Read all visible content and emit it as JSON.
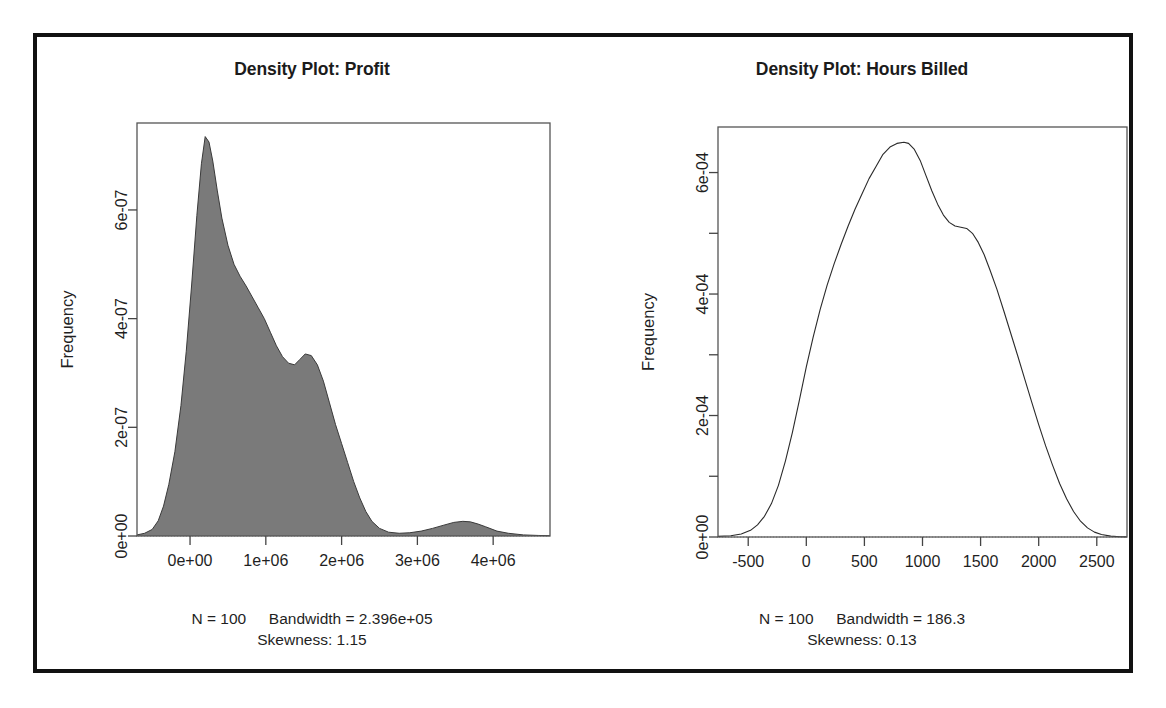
{
  "figure": {
    "background": "#ffffff",
    "border_color": "#111111",
    "panels": [
      {
        "id": "profit",
        "title": "Density Plot: Profit",
        "ylabel": "Frequency",
        "footer_n": "N = 100",
        "footer_bandwidth": "Bandwidth = 2.396e+05",
        "footer_skewness": "Skewness: 1.15"
      },
      {
        "id": "hours-billed",
        "title": "Density Plot: Hours Billed",
        "ylabel": "Frequency",
        "footer_n": "N = 100",
        "footer_bandwidth": "Bandwidth = 186.3",
        "footer_skewness": "Skewness: 0.13"
      }
    ]
  },
  "chart_data": [
    {
      "type": "area",
      "id": "profit",
      "title": "Density Plot: Profit",
      "xlabel": "",
      "ylabel": "Frequency",
      "fill_color": "#7a7a7a",
      "line_color": "#3a3a3a",
      "filled": true,
      "grid": false,
      "legend": null,
      "xlim": [
        -700000,
        4750000
      ],
      "ylim": [
        0,
        7.6e-07
      ],
      "xticks": [
        0,
        1000000,
        2000000,
        3000000,
        4000000
      ],
      "xticklabels": [
        "0e+00",
        "1e+06",
        "2e+06",
        "3e+06",
        "4e+06"
      ],
      "yticks": [
        0,
        2e-07,
        4e-07,
        6e-07
      ],
      "yticklabels": [
        "0e+00",
        "2e-07",
        "4e-07",
        "6e-07"
      ],
      "annotations": [
        "N = 100",
        "Bandwidth = 2.396e+05",
        "Skewness: 1.15"
      ],
      "n": 100,
      "bandwidth": 239600,
      "skewness": 1.15,
      "x": [
        -700000,
        -600000,
        -500000,
        -420000,
        -350000,
        -280000,
        -200000,
        -120000,
        -50000,
        20000,
        90000,
        150000,
        200000,
        250000,
        300000,
        360000,
        420000,
        500000,
        580000,
        660000,
        740000,
        820000,
        900000,
        980000,
        1060000,
        1140000,
        1220000,
        1300000,
        1380000,
        1450000,
        1520000,
        1600000,
        1680000,
        1760000,
        1840000,
        1920000,
        2000000,
        2080000,
        2160000,
        2240000,
        2320000,
        2400000,
        2500000,
        2620000,
        2760000,
        2900000,
        3050000,
        3200000,
        3350000,
        3480000,
        3600000,
        3700000,
        3800000,
        3900000,
        4050000,
        4200000,
        4400000,
        4600000,
        4750000
      ],
      "y": [
        2e-09,
        5e-09,
        1.2e-08,
        2.8e-08,
        5.5e-08,
        9.5e-08,
        1.55e-07,
        2.4e-07,
        3.4e-07,
        4.6e-07,
        5.9e-07,
        6.85e-07,
        7.35e-07,
        7.25e-07,
        6.9e-07,
        6.35e-07,
        5.85e-07,
        5.35e-07,
        5e-07,
        4.78e-07,
        4.6e-07,
        4.4e-07,
        4.2e-07,
        4e-07,
        3.75e-07,
        3.5e-07,
        3.3e-07,
        3.18e-07,
        3.15e-07,
        3.25e-07,
        3.35e-07,
        3.32e-07,
        3.15e-07,
        2.85e-07,
        2.45e-07,
        2.05e-07,
        1.7e-07,
        1.35e-07,
        1e-07,
        7e-08,
        4.5e-08,
        2.7e-08,
        1.4e-08,
        7e-09,
        5e-09,
        6e-09,
        9e-09,
        1.4e-08,
        2e-08,
        2.5e-08,
        2.7e-08,
        2.6e-08,
        2.2e-08,
        1.7e-08,
        9e-09,
        5e-09,
        2e-09,
        1e-09,
        5e-10
      ]
    },
    {
      "type": "line",
      "id": "hours-billed",
      "title": "Density Plot: Hours Billed",
      "xlabel": "",
      "ylabel": "Frequency",
      "fill_color": null,
      "line_color": "#2a2a2a",
      "filled": false,
      "grid": false,
      "legend": null,
      "xlim": [
        -760,
        2760
      ],
      "ylim": [
        0,
        0.000675
      ],
      "xticks": [
        -500,
        0,
        500,
        1000,
        1500,
        2000,
        2500
      ],
      "xticklabels": [
        "-500",
        "0",
        "500",
        "1000",
        "1500",
        "2000",
        "2500"
      ],
      "yticks": [
        0,
        0.0001,
        0.0002,
        0.0003,
        0.0004,
        0.0005,
        0.0006
      ],
      "yticklabels": [
        "0e+00",
        "",
        "2e-04",
        "",
        "4e-04",
        "",
        "6e-04"
      ],
      "annotations": [
        "N = 100",
        "Bandwidth = 186.3",
        "Skewness: 0.13"
      ],
      "n": 100,
      "bandwidth": 186.3,
      "skewness": 0.13,
      "x": [
        -760,
        -650,
        -560,
        -480,
        -420,
        -360,
        -300,
        -240,
        -180,
        -120,
        -60,
        0,
        60,
        120,
        180,
        240,
        300,
        360,
        420,
        480,
        540,
        600,
        660,
        720,
        780,
        840,
        880,
        930,
        980,
        1030,
        1080,
        1130,
        1180,
        1230,
        1280,
        1330,
        1380,
        1430,
        1480,
        1530,
        1580,
        1640,
        1700,
        1760,
        1820,
        1880,
        1940,
        2000,
        2060,
        2120,
        2180,
        2240,
        2300,
        2360,
        2420,
        2480,
        2540,
        2620,
        2700,
        2760
      ],
      "y": [
        1e-06,
        2e-06,
        5e-06,
        1.1e-05,
        2e-05,
        3.4e-05,
        5.5e-05,
        8.5e-05,
        0.000125,
        0.000172,
        0.000225,
        0.00028,
        0.00033,
        0.000375,
        0.000415,
        0.00045,
        0.000482,
        0.000512,
        0.00054,
        0.000565,
        0.00059,
        0.00061,
        0.00063,
        0.000642,
        0.000648,
        0.00065,
        0.000648,
        0.000638,
        0.00062,
        0.000595,
        0.00057,
        0.000548,
        0.00053,
        0.000518,
        0.000512,
        0.00051,
        0.000508,
        0.0005,
        0.000485,
        0.000465,
        0.00044,
        0.000408,
        0.000372,
        0.000335,
        0.000298,
        0.00026,
        0.000222,
        0.000185,
        0.00015,
        0.000118,
        8.8e-05,
        6.3e-05,
        4.2e-05,
        2.6e-05,
        1.5e-05,
        8e-06,
        4e-06,
        1.5e-06,
        5e-07,
        2e-07
      ]
    }
  ]
}
